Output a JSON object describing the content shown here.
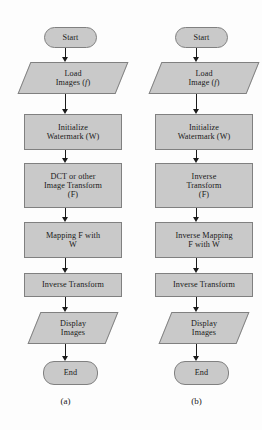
{
  "figure": {
    "background_color": "#fdfdfd",
    "node_fill_color": "#c9c9c9",
    "node_border_color": "#808080",
    "connector_color": "#1a1a1a"
  },
  "charts": [
    {
      "id": "a",
      "caption": "(a)",
      "nodes": [
        {
          "shape": "terminator",
          "lines": [
            "Start"
          ]
        },
        {
          "shape": "io",
          "lines": [
            "Load",
            "Images (f)"
          ]
        },
        {
          "shape": "process",
          "lines": [
            "Initialize",
            "Watermark (W)"
          ]
        },
        {
          "shape": "process",
          "lines": [
            "DCT or other",
            "Image Transform",
            "(F)"
          ]
        },
        {
          "shape": "process",
          "lines": [
            "Mapping F with",
            "W"
          ]
        },
        {
          "shape": "process",
          "lines": [
            "Inverse Transform"
          ]
        },
        {
          "shape": "io",
          "lines": [
            "Display",
            "Images"
          ]
        },
        {
          "shape": "terminator",
          "lines": [
            "End"
          ]
        }
      ]
    },
    {
      "id": "b",
      "caption": "(b)",
      "nodes": [
        {
          "shape": "terminator",
          "lines": [
            "Start"
          ]
        },
        {
          "shape": "io",
          "lines": [
            "Load",
            "Image (f)"
          ]
        },
        {
          "shape": "process",
          "lines": [
            "Initialize",
            "Watermark (W)"
          ]
        },
        {
          "shape": "process",
          "lines": [
            "Inverse",
            "Transform",
            "(F)"
          ]
        },
        {
          "shape": "process",
          "lines": [
            "Inverse Mapping",
            "F with W"
          ]
        },
        {
          "shape": "process",
          "lines": [
            "Inverse Transform"
          ]
        },
        {
          "shape": "io",
          "lines": [
            "Display",
            "Images"
          ]
        },
        {
          "shape": "terminator",
          "lines": [
            "End"
          ]
        }
      ]
    }
  ]
}
